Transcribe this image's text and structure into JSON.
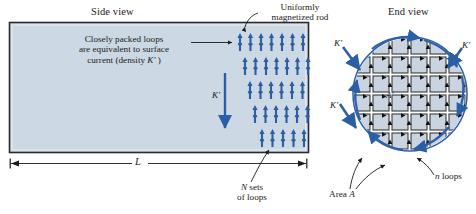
{
  "figure": {
    "background": "#ffffff",
    "rod_fill": "#ccd8e4",
    "rod_stroke": "#2b2b2b",
    "arrow_color": "#2a5fa5",
    "cell_fill": "#c9d4e0",
    "cell_stroke": "#3a3a3a",
    "loop_arrow_color": "#111111",
    "surface_arrow_color": "#2f5fa8",
    "circle_stroke": "#2a5fa5"
  },
  "side_view": {
    "title": "Side view",
    "callout_loops": {
      "line1": "Closely packed loops",
      "line2": "are equivalent to surface",
      "line3_prefix": "current (density ",
      "line3_symbol": "K′",
      "line3_suffix": " )"
    },
    "magnetized_rod_label": {
      "line1": "Uniformly",
      "line2": "magnetized rod"
    },
    "surface_current_symbol": "K′",
    "length_label": "L",
    "n_sets_label": {
      "line1_symbol": "N",
      "line1_text": " sets",
      "line2": "of loops"
    },
    "arrow_grid": {
      "rows": 5,
      "cols": 7,
      "description": "grid of upward magnetization arrows"
    }
  },
  "end_view": {
    "title": "End view",
    "surface_current_symbol_left": "K′",
    "surface_current_symbol_right": "K′",
    "surface_current_symbol_lower_left": "K′",
    "cell_area_symbol": "A′",
    "area_label_prefix": "Area ",
    "area_label_symbol": "A",
    "n_loops_symbol": "n",
    "n_loops_text": " loops"
  }
}
